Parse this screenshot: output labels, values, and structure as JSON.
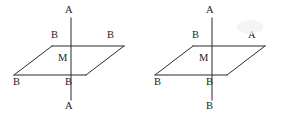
{
  "canvas": {
    "width": 282,
    "height": 117,
    "background": "#ffffff",
    "ink_color": "#2b2b2b",
    "text_color": "#1c1c1c"
  },
  "figures": [
    {
      "id": "left-figure",
      "name": "axial-equatorial-diagram-left",
      "description": "Trigonal bipyramid style plane with vertical axis; axis positions labelled A, equatorial positions labelled B",
      "axis": {
        "top_label": "A",
        "bottom_label": "A",
        "center_label": "M"
      },
      "plane_labels": {
        "upper_left": "B",
        "upper_right": "B",
        "lower_left": "B",
        "lower_right": "B"
      },
      "geometry": {
        "parallelogram": [
          {
            "x": 14,
            "y": 75
          },
          {
            "x": 52,
            "y": 46
          },
          {
            "x": 124,
            "y": 46
          },
          {
            "x": 86,
            "y": 75
          }
        ],
        "horizontal_midline": {
          "x1": 52,
          "y1": 46,
          "x2": 124,
          "y2": 46
        },
        "bottom_edge": {
          "x1": 14,
          "y1": 75,
          "x2": 86,
          "y2": 75
        },
        "vertical_axis": {
          "x": 71,
          "y_top": 18,
          "y_bottom": 100
        },
        "center_point": {
          "x": 71,
          "y": 60
        }
      }
    },
    {
      "id": "right-figure",
      "name": "axial-equatorial-diagram-right",
      "description": "Same skeleton with one axial position labelled A at top, B at bottom, and one equatorial position labelled A",
      "axis": {
        "top_label": "A",
        "bottom_label": "B",
        "center_label": "M"
      },
      "plane_labels": {
        "upper_left": "B",
        "upper_right": "A",
        "lower_left": "B",
        "lower_right": "B"
      },
      "geometry": {
        "parallelogram": [
          {
            "x": 14,
            "y": 75
          },
          {
            "x": 52,
            "y": 46
          },
          {
            "x": 124,
            "y": 46
          },
          {
            "x": 86,
            "y": 75
          }
        ],
        "horizontal_midline": {
          "x1": 52,
          "y1": 46,
          "x2": 124,
          "y2": 46
        },
        "bottom_edge": {
          "x1": 14,
          "y1": 75,
          "x2": 86,
          "y2": 75
        },
        "vertical_axis": {
          "x": 71,
          "y_top": 18,
          "y_bottom": 100
        },
        "center_point": {
          "x": 71,
          "y": 60
        }
      }
    }
  ]
}
